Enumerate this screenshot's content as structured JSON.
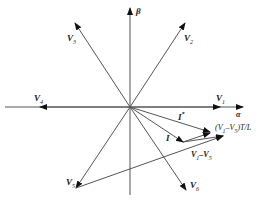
{
  "diagram": {
    "colors": {
      "line": "#444444",
      "arrow": "#111111",
      "background": "#ffffff"
    },
    "axes": {
      "alpha_label": "α",
      "beta_label": "β"
    },
    "vectors": [
      {
        "id": "V1",
        "label": "V",
        "sub": "1"
      },
      {
        "id": "V2",
        "label": "V",
        "sub": "2"
      },
      {
        "id": "V3",
        "label": "V",
        "sub": "3"
      },
      {
        "id": "V4",
        "label": "V",
        "sub": "4"
      },
      {
        "id": "V5",
        "label": "V",
        "sub": "5"
      },
      {
        "id": "V6",
        "label": "V",
        "sub": "6"
      }
    ],
    "currents": {
      "i_ref_label": "I",
      "i_ref_sup": "*",
      "i_label": "I"
    },
    "annotations": {
      "delta_label": "(V",
      "delta_sub1": "1",
      "delta_mid": "–V",
      "delta_sub2": "5",
      "delta_tail": ")T/L",
      "diff_label_a": "V",
      "diff_sub_a": "1",
      "diff_label_b": "–V",
      "diff_sub_b": "5"
    }
  }
}
